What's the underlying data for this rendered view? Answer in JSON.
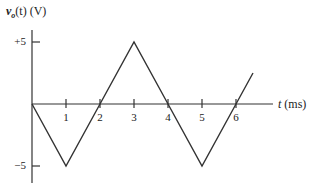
{
  "chart_data": {
    "type": "line",
    "title": "",
    "ylabel": "v_o(t) (V)",
    "ylabel_parts": {
      "var": "v",
      "sub": "o",
      "rest": "(t) (V)"
    },
    "xlabel": "t (ms)",
    "xlabel_parts": {
      "var": "t",
      "rest": " (ms)"
    },
    "x": [
      0,
      1,
      2,
      3,
      4,
      5,
      6,
      6.5
    ],
    "series": [
      {
        "name": "v_o(t)",
        "values": [
          0,
          -5,
          0,
          5,
          0,
          -5,
          0,
          2.5
        ]
      }
    ],
    "x_ticks": [
      "1",
      "2",
      "3",
      "4",
      "5",
      "6"
    ],
    "y_ticks": [
      "+5",
      "−5"
    ],
    "xlim": [
      0,
      6.5
    ],
    "ylim": [
      -5,
      5
    ],
    "grid": false,
    "legend": "none",
    "line_color": "#333333",
    "waveform": "triangle",
    "amplitude_V": 5,
    "period_ms": 4
  }
}
